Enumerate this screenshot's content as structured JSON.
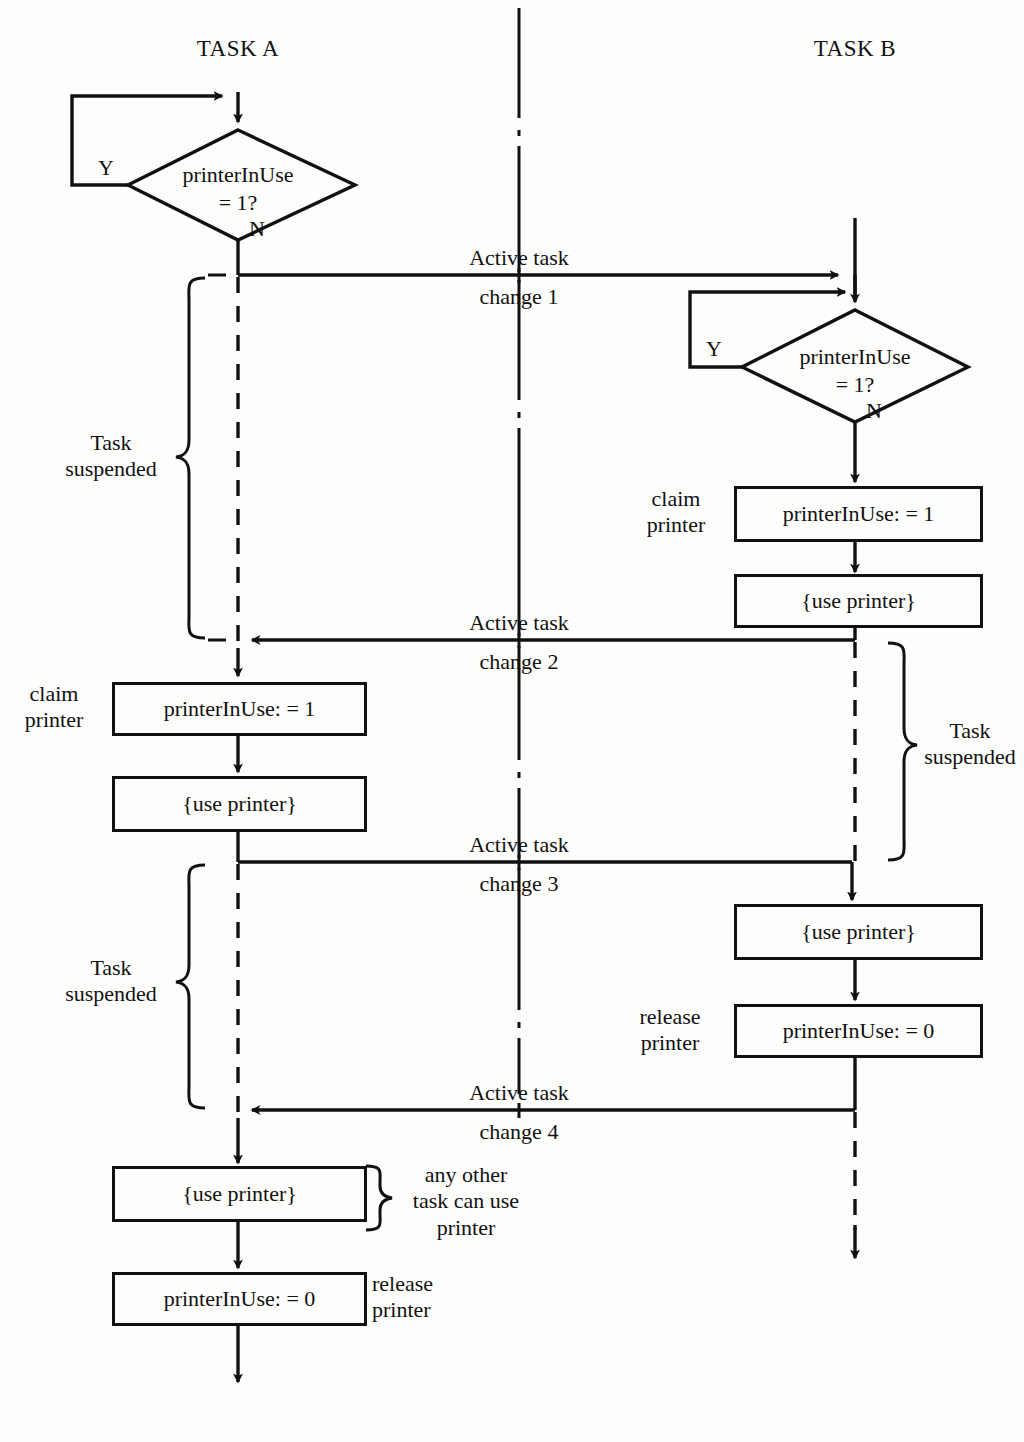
{
  "diagram": {
    "lanes": [
      {
        "id": "task-a",
        "label": "TASK A"
      },
      {
        "id": "task-b",
        "label": "TASK B"
      }
    ],
    "colors": {
      "ink": "#111111",
      "paper": "#fdfdfb"
    },
    "decisions": [
      {
        "id": "decision-a",
        "line1": "printerInUse",
        "line2": "= 1?",
        "yes": "Y",
        "no": "N"
      },
      {
        "id": "decision-b",
        "line1": "printerInUse",
        "line2": "= 1?",
        "yes": "Y",
        "no": "N"
      }
    ],
    "boxes": [
      {
        "id": "a-claim",
        "text": "printerInUse: = 1"
      },
      {
        "id": "a-use-1",
        "text": "{use printer}"
      },
      {
        "id": "a-use-2",
        "text": "{use printer}"
      },
      {
        "id": "a-release",
        "text": "printerInUse: = 0"
      },
      {
        "id": "b-claim",
        "text": "printerInUse: = 1"
      },
      {
        "id": "b-use-1",
        "text": "{use printer}"
      },
      {
        "id": "b-use-2",
        "text": "{use printer}"
      },
      {
        "id": "b-release",
        "text": "printerInUse: = 0"
      }
    ],
    "annotations": [
      {
        "id": "a-claim-note",
        "text": "claim\nprinter"
      },
      {
        "id": "b-claim-note",
        "text": "claim\nprinter"
      },
      {
        "id": "b-release-note",
        "text": "release\nprinter"
      },
      {
        "id": "a-release-note",
        "text": "release\nprinter"
      },
      {
        "id": "a-suspend-1",
        "text": "Task\nsuspended"
      },
      {
        "id": "a-suspend-2",
        "text": "Task\nsuspended"
      },
      {
        "id": "b-suspend-1",
        "text": "Task\nsuspended"
      },
      {
        "id": "any-other-task",
        "text": "any other\ntask can use\nprinter"
      }
    ],
    "transitions": [
      {
        "id": "change-1",
        "top": "Active task",
        "bottom": "change 1",
        "direction": "a-to-b"
      },
      {
        "id": "change-2",
        "top": "Active task",
        "bottom": "change 2",
        "direction": "b-to-a"
      },
      {
        "id": "change-3",
        "top": "Active task",
        "bottom": "change 3",
        "direction": "a-to-b"
      },
      {
        "id": "change-4",
        "top": "Active task",
        "bottom": "change 4",
        "direction": "b-to-a"
      }
    ]
  }
}
